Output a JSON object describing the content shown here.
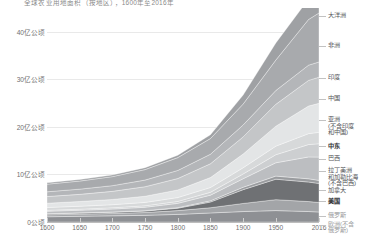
{
  "chart_title": "全球农业用地面积（按地区），1600年至2016年",
  "chart_data": {
    "type": "area",
    "stacked": true,
    "title": "全球农业用地面积（按地区），1600年至2016年",
    "xlabel": "",
    "ylabel": "",
    "xlim": [
      1600,
      2016
    ],
    "ylim": [
      0,
      45
    ],
    "unit": "亿公顷",
    "grid": true,
    "legend_position": "right",
    "x_ticks": [
      {
        "value": 1600,
        "label": "1600"
      },
      {
        "value": 1650,
        "label": "1650"
      },
      {
        "value": 1700,
        "label": "1700"
      },
      {
        "value": 1750,
        "label": "1750"
      },
      {
        "value": 1800,
        "label": "1800"
      },
      {
        "value": 1850,
        "label": "1850"
      },
      {
        "value": 1900,
        "label": "1900"
      },
      {
        "value": 1950,
        "label": "1950"
      },
      {
        "value": 2016,
        "label": "2016"
      }
    ],
    "y_ticks": [
      {
        "value": 0,
        "label": "0公顷"
      },
      {
        "value": 10,
        "label": "10亿公顷"
      },
      {
        "value": 20,
        "label": "20亿公顷"
      },
      {
        "value": 30,
        "label": "30亿公顷"
      },
      {
        "value": 40,
        "label": "40亿公顷"
      }
    ],
    "x": [
      1600,
      1650,
      1700,
      1750,
      1800,
      1850,
      1900,
      1950,
      2000,
      2016
    ],
    "series": [
      {
        "name": "欧洲(不含俄罗斯)",
        "legend_label": "欧洲(不含\n俄罗斯)",
        "color": "#8e9094",
        "values": [
          1.1,
          1.2,
          1.3,
          1.4,
          1.6,
          1.9,
          2.2,
          2.4,
          2.2,
          2.1
        ]
      },
      {
        "name": "俄罗斯",
        "legend_label": "俄罗斯",
        "color": "#a3a5a8",
        "values": [
          0.4,
          0.45,
          0.5,
          0.6,
          0.8,
          1.1,
          1.7,
          2.3,
          2.1,
          2.0
        ]
      },
      {
        "name": "美国",
        "legend_label": "美国",
        "color": "#6f7174",
        "values": [
          0.2,
          0.22,
          0.25,
          0.3,
          0.5,
          1.2,
          2.9,
          4.3,
          4.1,
          4.0
        ]
      },
      {
        "name": "加拿大",
        "legend_label": "加拿大",
        "color": "#9a9c9f",
        "values": [
          0.05,
          0.05,
          0.06,
          0.08,
          0.12,
          0.25,
          0.5,
          0.65,
          0.68,
          0.65
        ]
      },
      {
        "name": "拉丁美洲和加勒比海(不含巴西)",
        "legend_label": "拉丁美洲\n和加勒比海\n(不含巴西)",
        "color": "#bcbec1",
        "values": [
          0.5,
          0.55,
          0.62,
          0.72,
          0.9,
          1.2,
          1.8,
          2.8,
          4.6,
          4.9
        ]
      },
      {
        "name": "巴西",
        "legend_label": "巴西",
        "color": "#cdcfd1",
        "values": [
          0.2,
          0.22,
          0.25,
          0.3,
          0.4,
          0.6,
          1.0,
          1.7,
          2.6,
          2.8
        ]
      },
      {
        "name": "中东",
        "legend_label": "中东",
        "color": "#d7d9da",
        "values": [
          0.6,
          0.62,
          0.66,
          0.72,
          0.82,
          1.0,
          1.3,
          1.8,
          2.3,
          2.4
        ]
      },
      {
        "name": "亚洲(不含印度和中国)",
        "legend_label": "亚洲\n(不含印度\n和中国)",
        "color": "#e3e5e6",
        "values": [
          0.9,
          1.0,
          1.1,
          1.3,
          1.6,
          2.1,
          2.9,
          4.2,
          5.8,
          6.1
        ]
      },
      {
        "name": "中国",
        "legend_label": "中国",
        "color": "#c4c6c8",
        "values": [
          1.4,
          1.5,
          1.7,
          2.0,
          2.4,
          2.9,
          3.6,
          4.6,
          5.4,
          5.5
        ]
      },
      {
        "name": "印度",
        "legend_label": "印度",
        "color": "#b4b6b9",
        "values": [
          1.0,
          1.1,
          1.2,
          1.4,
          1.7,
          2.0,
          2.5,
          2.9,
          3.2,
          3.2
        ]
      },
      {
        "name": "非洲",
        "legend_label": "非洲",
        "color": "#a8aaad",
        "values": [
          1.6,
          1.7,
          1.9,
          2.2,
          2.7,
          3.3,
          4.4,
          6.4,
          9.6,
          10.3
        ]
      },
      {
        "name": "大洋洲",
        "legend_label": "大洋洲",
        "color": "#9fa1a4",
        "values": [
          0.3,
          0.32,
          0.35,
          0.4,
          0.5,
          0.8,
          1.9,
          3.6,
          4.3,
          4.2
        ]
      }
    ]
  }
}
